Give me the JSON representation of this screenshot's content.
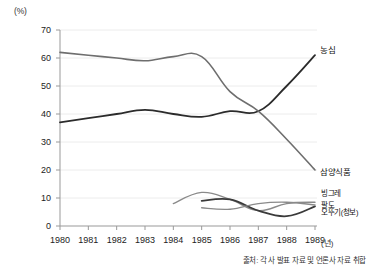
{
  "chart_data": {
    "type": "line",
    "title": "",
    "xlabel": "년",
    "ylabel": "%",
    "x": [
      1980,
      1981,
      1982,
      1983,
      1984,
      1985,
      1986,
      1987,
      1988,
      1989
    ],
    "xlim": [
      1980,
      1989
    ],
    "ylim": [
      0,
      70
    ],
    "yticks": [
      0,
      10,
      20,
      30,
      40,
      50,
      60,
      70
    ],
    "xticks": [
      "1980",
      "1981",
      "1982",
      "1983",
      "1984",
      "1985",
      "1986",
      "1987",
      "1988",
      "1989"
    ],
    "grid": true,
    "legend_position": "inline-right",
    "series": [
      {
        "name": "농심",
        "color": "#2b2b2b",
        "width": 1.8,
        "x": [
          1980,
          1981,
          1982,
          1983,
          1984,
          1985,
          1986,
          1987,
          1988,
          1989
        ],
        "values": [
          37,
          38.5,
          40,
          41.5,
          40,
          39,
          41,
          41,
          50,
          61
        ]
      },
      {
        "name": "삼양식품",
        "color": "#6e6e6e",
        "width": 1.6,
        "x": [
          1980,
          1981,
          1982,
          1983,
          1984,
          1985,
          1986,
          1987,
          1988,
          1989
        ],
        "values": [
          62,
          61,
          60,
          59,
          60.5,
          60.5,
          48,
          41,
          31,
          20
        ]
      },
      {
        "name": "빙그레",
        "color": "#8a8a8a",
        "width": 1.4,
        "x": [
          1984,
          1985,
          1986,
          1987,
          1988,
          1989
        ],
        "values": [
          8,
          12,
          9.5,
          5.5,
          8,
          8.5
        ]
      },
      {
        "name": "팔도",
        "color": "#3a3a3a",
        "width": 1.8,
        "x": [
          1985,
          1986,
          1987,
          1988,
          1989
        ],
        "values": [
          9,
          9.5,
          5.5,
          3.5,
          7
        ]
      },
      {
        "name": "오뚜기(청보)",
        "color": "#8a8a8a",
        "width": 1.4,
        "x": [
          1985,
          1986,
          1987,
          1988,
          1989
        ],
        "values": [
          6.5,
          6,
          8,
          8.5,
          7.5
        ]
      }
    ]
  },
  "axis": {
    "y_unit": "(%)",
    "x_unit": "(년)"
  },
  "labels": {
    "nongshim": "농심",
    "samyang": "삼양식품",
    "binggrae": "빙그레",
    "paldo": "팔도",
    "ottogi": "오뚜기(청보)"
  },
  "source": {
    "text": "출처: 각 사 발표 자료 및 언론사 자료 취합"
  }
}
